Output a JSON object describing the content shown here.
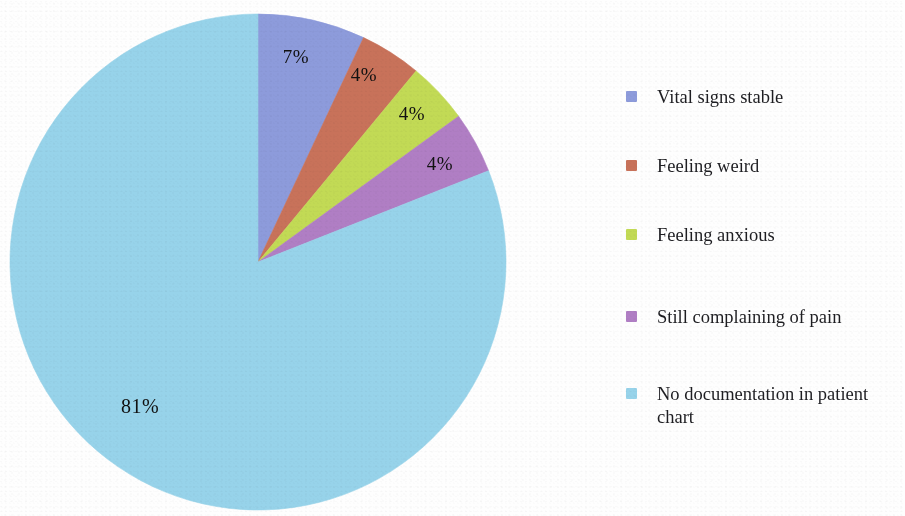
{
  "chart_data": {
    "type": "pie",
    "title": "",
    "subtitle": "",
    "xlabel": "",
    "ylabel": "",
    "legend_position": "right",
    "grid": false,
    "start_angle_deg": 0,
    "direction": "clockwise",
    "categories": [
      "Vital signs stable",
      "Feeling weird",
      "Feeling anxious",
      "Still complaining of pain",
      "No documentation in patient chart"
    ],
    "values": [
      7,
      4,
      4,
      4,
      81
    ],
    "unit": "%",
    "data_labels": [
      "7%",
      "4%",
      "4%",
      "4%",
      "81%"
    ],
    "colors": [
      "#8d9bdb",
      "#c8725a",
      "#c2da55",
      "#b07ec4",
      "#97d3ea"
    ],
    "slices": [
      {
        "label": "Vital signs stable",
        "value": 7,
        "data_label": "7%",
        "color": "#8d9bdb"
      },
      {
        "label": "Feeling weird",
        "value": 4,
        "data_label": "4%",
        "color": "#c8725a"
      },
      {
        "label": "Feeling anxious",
        "value": 4,
        "data_label": "4%",
        "color": "#c2da55"
      },
      {
        "label": "Still complaining of pain",
        "value": 4,
        "data_label": "4%",
        "color": "#b07ec4"
      },
      {
        "label": "No documentation in patient chart",
        "value": 81,
        "data_label": "81%",
        "color": "#97d3ea"
      }
    ]
  },
  "legend": {
    "items": [
      {
        "label": "Vital signs stable",
        "color": "#8d9bdb"
      },
      {
        "label": "Feeling weird",
        "color": "#c8725a"
      },
      {
        "label": "Feeling anxious",
        "color": "#c2da55"
      },
      {
        "label": "Still complaining of pain",
        "color": "#b07ec4"
      },
      {
        "label": "No documentation in patient chart",
        "color": "#97d3ea"
      }
    ]
  },
  "pie_geometry": {
    "cx": 258,
    "cy": 262,
    "r": 248
  },
  "label_positions": [
    {
      "text": "7%",
      "x": 296,
      "y": 57
    },
    {
      "text": "4%",
      "x": 364,
      "y": 75
    },
    {
      "text": "4%",
      "x": 412,
      "y": 114
    },
    {
      "text": "4%",
      "x": 440,
      "y": 164
    },
    {
      "text": "81%",
      "x": 140,
      "y": 406
    }
  ],
  "legend_rows_y": [
    0,
    69,
    138,
    220,
    297
  ]
}
